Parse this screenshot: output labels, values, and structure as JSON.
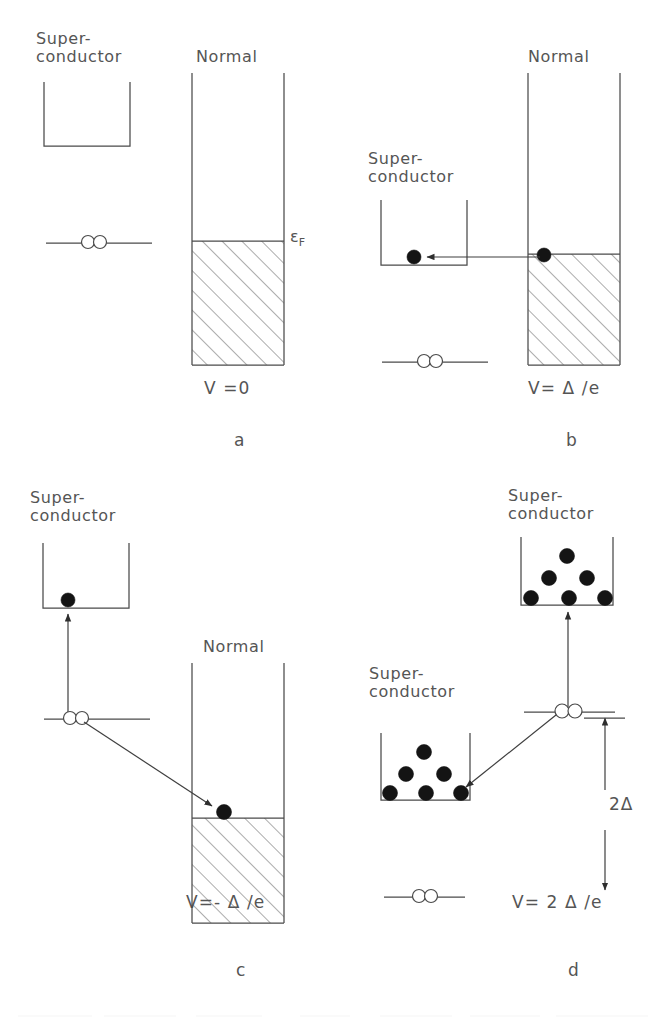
{
  "figure": {
    "background_color": "#ffffff",
    "ink_color": "#4a4a4a",
    "filled_dot_color": "#141414"
  },
  "labels": {
    "superconductor_line1": "Super-",
    "superconductor_line2": "conductor",
    "normal": "Normal",
    "fermi_symbol": "ε",
    "fermi_subscript": "F",
    "gap_2delta": "2Δ"
  },
  "panels": [
    {
      "id": "a",
      "panel_label": "a",
      "voltage_label": "V =0",
      "left_electrode": "superconductor",
      "left_electrode_label_lines": [
        "Super-",
        "conductor"
      ],
      "left_electrode_dots": 0,
      "right_electrode": "normal",
      "right_electrode_label": "Normal",
      "fermi_label": "εF",
      "cooper_pair_open_circles": 2,
      "arrows": [],
      "hatched_region": true
    },
    {
      "id": "b",
      "panel_label": "b",
      "voltage_label": "V= Δ /e",
      "left_electrode": "superconductor",
      "left_electrode_label_lines": [
        "Super-",
        "conductor"
      ],
      "left_electrode_dots": 1,
      "right_electrode": "normal",
      "right_electrode_label": "Normal",
      "cooper_pair_open_circles": 2,
      "arrows": [
        {
          "from": "normal-fermi-surface",
          "to": "superconductor-bottom",
          "direction": "left"
        }
      ],
      "hatched_region": true
    },
    {
      "id": "c",
      "panel_label": "c",
      "voltage_label": "V=- Δ /e",
      "left_electrode": "superconductor",
      "left_electrode_label_lines": [
        "Super-",
        "conductor"
      ],
      "left_electrode_dots": 1,
      "right_electrode": "normal",
      "right_electrode_label": "Normal",
      "cooper_pair_open_circles": 2,
      "arrows": [
        {
          "from": "cooper-pair-level",
          "to": "superconductor-bottom",
          "direction": "up"
        },
        {
          "from": "cooper-pair-level",
          "to": "normal-fermi-surface",
          "direction": "down-right"
        }
      ],
      "hatched_region": true
    },
    {
      "id": "d",
      "panel_label": "d",
      "voltage_label": "V= 2 Δ /e",
      "gap_label": "2Δ",
      "upper_electrode": "superconductor",
      "upper_electrode_label_lines": [
        "Super-",
        "conductor"
      ],
      "upper_electrode_dots": 6,
      "lower_electrode": "superconductor",
      "lower_electrode_label_lines": [
        "Super-",
        "conductor"
      ],
      "lower_electrode_dots": 6,
      "cooper_pair_open_circles": 2,
      "arrows": [
        {
          "from": "cooper-pair-level",
          "to": "upper-superconductor-bottom",
          "direction": "up"
        },
        {
          "from": "cooper-pair-level",
          "to": "lower-superconductor-bottom",
          "direction": "down-left"
        },
        {
          "from": "cooper-pair-level",
          "to": "voltage-level",
          "direction": "double-headed-vertical",
          "label": "2Δ"
        }
      ],
      "hatched_region": false
    }
  ]
}
